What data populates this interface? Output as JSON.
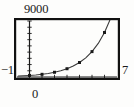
{
  "figure": {
    "caption_labels": {
      "ymax": "9000",
      "xmin": "−1",
      "xmax": "7",
      "xorigin": "0"
    }
  },
  "chart_data": {
    "type": "scatter",
    "title": "",
    "subtitle": "",
    "xlabel": "",
    "ylabel": "",
    "xlim": [
      -1,
      7
    ],
    "ylim": [
      0,
      9000
    ],
    "grid": false,
    "legend": null,
    "axis_style": "graphing-calculator-window",
    "tick_labels": {
      "x": [
        "−1",
        "0",
        "7"
      ],
      "y": [
        "9000"
      ]
    },
    "x_tick_interval": 1,
    "y_tick_interval": 1000,
    "x_ticks": [
      -1,
      0,
      1,
      2,
      3,
      4,
      5,
      6,
      7
    ],
    "y_ticks": [
      0,
      1000,
      2000,
      3000,
      4000,
      5000,
      6000,
      7000,
      8000,
      9000
    ],
    "x": [
      0,
      1,
      2,
      3,
      4,
      5,
      6
    ],
    "values": [
      250,
      430,
      760,
      1330,
      2330,
      4080,
      7150
    ],
    "series": [
      {
        "name": "data points",
        "marker": "square",
        "color": "#1a1a1a",
        "x": [
          0,
          1,
          2,
          3,
          4,
          5,
          6
        ],
        "values": [
          250,
          430,
          760,
          1330,
          2330,
          4080,
          7150
        ]
      },
      {
        "name": "exponential fit curve",
        "marker": "none",
        "line": "solid",
        "color": "#3a3a3a",
        "equation_form": "y = a*b^x",
        "x": [
          -0.9,
          -0.5,
          0,
          0.5,
          1,
          1.5,
          2,
          2.5,
          3,
          3.5,
          4,
          4.5,
          5,
          5.5,
          6,
          6.5,
          6.9
        ],
        "values": [
          155,
          190,
          250,
          328,
          430,
          572,
          760,
          1006,
          1330,
          1760,
          2330,
          3082,
          4080,
          5400,
          7150,
          9460,
          11900
        ]
      }
    ]
  }
}
